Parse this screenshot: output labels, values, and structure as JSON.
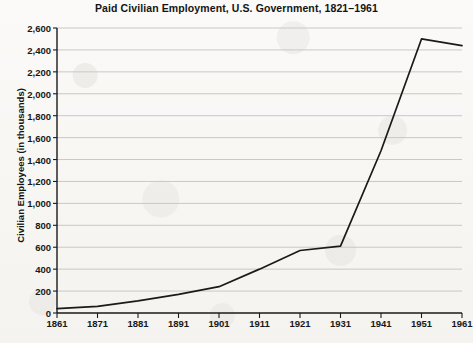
{
  "chart_data": {
    "type": "line",
    "title": "Paid Civilian Employment, U.S. Government, 1821–1961",
    "xlabel": "",
    "ylabel": "Civilian Employees (in thousands)",
    "x": [
      1861,
      1871,
      1881,
      1891,
      1901,
      1911,
      1921,
      1931,
      1941,
      1951,
      1961
    ],
    "values": [
      40,
      60,
      110,
      170,
      240,
      400,
      570,
      610,
      1480,
      2500,
      2440
    ],
    "series": [
      {
        "name": "Paid civilian employees",
        "values": [
          40,
          60,
          110,
          170,
          240,
          400,
          570,
          610,
          1480,
          2500,
          2440
        ]
      }
    ],
    "categories": [
      "1861",
      "1871",
      "1881",
      "1891",
      "1901",
      "1911",
      "1921",
      "1931",
      "1941",
      "1951",
      "1961"
    ],
    "xtick_labels": [
      "1861",
      "1871",
      "1881",
      "1891",
      "1901",
      "1911",
      "1921",
      "1931",
      "1941",
      "1951",
      "1961"
    ],
    "ytick_labels": [
      "0",
      "200",
      "400",
      "600",
      "800",
      "1,000",
      "1,200",
      "1,400",
      "1,600",
      "1,800",
      "2,000",
      "2,200",
      "2,400",
      "2,600"
    ],
    "ytick_values": [
      0,
      200,
      400,
      600,
      800,
      1000,
      1200,
      1400,
      1600,
      1800,
      2000,
      2200,
      2400,
      2600
    ],
    "xlim": [
      1861,
      1961
    ],
    "ylim": [
      0,
      2600
    ],
    "grid": "horizontal",
    "legend": "none",
    "line_color": "#1a1a1a",
    "grid_color": "#c8c8c8",
    "axis_color": "#1a1a1a",
    "background_color": "#f7f6f3"
  }
}
